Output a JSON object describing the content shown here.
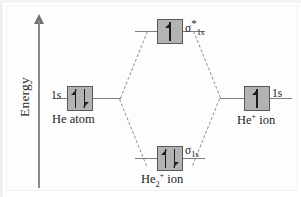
{
  "diagram": {
    "type": "molecular-orbital-energy-diagram",
    "axis": {
      "label": "Energy",
      "direction": "up",
      "arrow_icon": "up-arrow-icon"
    },
    "left_fragment": {
      "orbital_label": "1s",
      "species_label_html": "He atom",
      "species_text": "He atom",
      "electrons": 2,
      "spins": [
        "up",
        "down"
      ]
    },
    "right_fragment": {
      "orbital_label": "1s",
      "species_prefix": "He",
      "species_charge": "+",
      "species_suffix": " ion",
      "species_text": "He+ ion",
      "electrons": 1,
      "spins": [
        "up"
      ]
    },
    "molecular_orbitals": [
      {
        "id": "antibonding",
        "sigma": "σ",
        "star": "*",
        "subscript": "1s",
        "label_text": "σ*1s",
        "electrons": 1,
        "spins": [
          "up"
        ],
        "position": "top"
      },
      {
        "id": "bonding",
        "sigma": "σ",
        "star": "",
        "subscript": "1s",
        "label_text": "σ1s",
        "electrons": 2,
        "spins": [
          "up",
          "down"
        ],
        "position": "bottom"
      }
    ],
    "molecule": {
      "prefix": "He",
      "count": "2",
      "charge": "+",
      "suffix": " ion",
      "label_text": "He2+ ion"
    },
    "colors": {
      "box_fill": "#b3b3b3",
      "box_border": "#58585b",
      "line": "#7d7d81",
      "dashed_line": "#96969a",
      "text": "#232326",
      "background": "#fdfdfd"
    }
  }
}
